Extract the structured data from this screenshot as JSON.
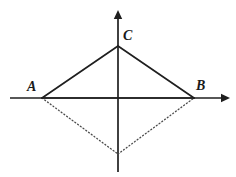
{
  "figure": {
    "background_color": "#ffffff",
    "width": 236,
    "height": 177,
    "stroke_color": "#1f1f1f",
    "dotted_color": "#4a4a4a",
    "solid_stroke_width": 1.7,
    "axis_stroke_width": 1.7,
    "dotted_stroke_width": 1.3,
    "dot_pattern": "1 2.4"
  },
  "axes": {
    "origin": {
      "x": 118,
      "y": 98
    },
    "x_axis": {
      "name": "horizontal-axis",
      "x1": 10,
      "y1": 98,
      "x2": 222,
      "y2": 98,
      "arrow_head": {
        "x": 230,
        "y": 98,
        "direction": "right"
      }
    },
    "y_axis": {
      "name": "vertical-axis",
      "x1": 118,
      "y1": 172,
      "x2": 118,
      "y2": 18,
      "arrow_head": {
        "x": 118,
        "y": 10,
        "direction": "up"
      }
    }
  },
  "points": [
    {
      "id": "A",
      "label": "A",
      "x": 42,
      "y": 98,
      "label_x": 27,
      "label_y": 80
    },
    {
      "id": "B",
      "label": "B",
      "x": 194,
      "y": 98,
      "label_x": 196,
      "label_y": 79
    },
    {
      "id": "C",
      "label": "C",
      "x": 118,
      "y": 46,
      "label_x": 123,
      "label_y": 29
    },
    {
      "id": "D",
      "label": "",
      "x": 118,
      "y": 154,
      "label_x": 0,
      "label_y": 0
    }
  ],
  "edges": [
    {
      "name": "segment-AC",
      "from": "A",
      "to": "C",
      "style": "solid"
    },
    {
      "name": "segment-CB",
      "from": "C",
      "to": "B",
      "style": "solid"
    },
    {
      "name": "segment-AB",
      "from": "A",
      "to": "B",
      "style": "solid"
    },
    {
      "name": "segment-AD",
      "from": "A",
      "to": "D",
      "style": "dotted"
    },
    {
      "name": "segment-DB",
      "from": "D",
      "to": "B",
      "style": "dotted"
    }
  ],
  "labels": {
    "A": "A",
    "B": "B",
    "C": "C"
  }
}
